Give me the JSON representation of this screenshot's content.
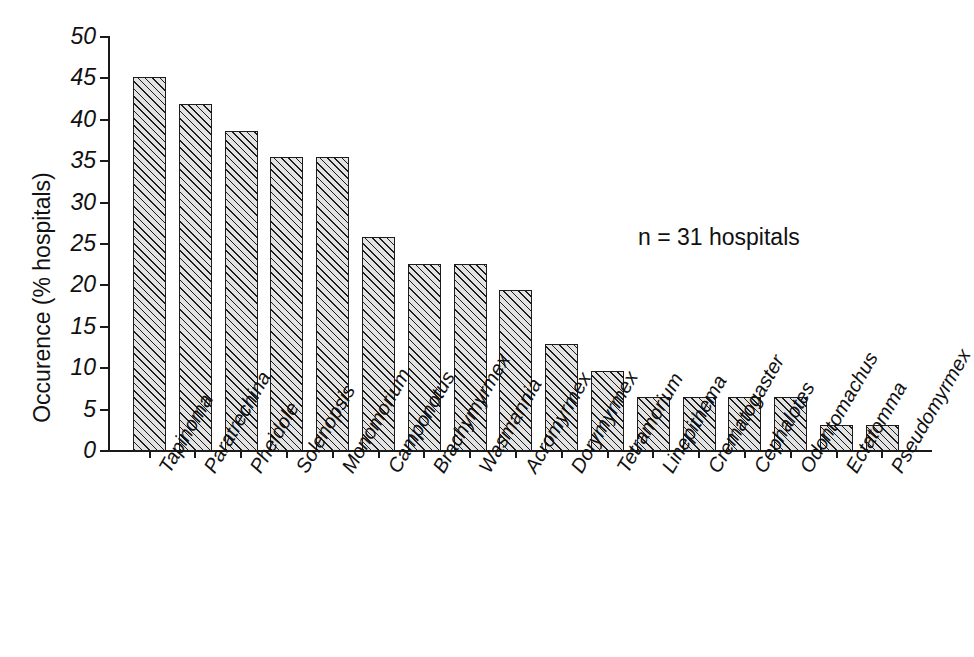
{
  "chart_data": {
    "type": "bar",
    "title": "",
    "subtitle": "",
    "xlabel": "",
    "ylabel": "Occurence (% hospitals)",
    "ylim": [
      0,
      50
    ],
    "ytick_values": [
      0,
      5,
      10,
      15,
      20,
      25,
      30,
      35,
      40,
      45,
      50
    ],
    "ytick_labels": [
      "0",
      "5",
      "10",
      "15",
      "20",
      "25",
      "30",
      "35",
      "40",
      "45",
      "50"
    ],
    "grid": false,
    "legend": null,
    "annotations": [
      {
        "name": "sample-size",
        "text": "n = 31 hospitals"
      }
    ],
    "categories": [
      "Tapinoma",
      "Paratrechina",
      "Pheidole",
      "Solenopsis",
      "Monomorium",
      "Camponotus",
      "Brachymyrmex",
      "Wasmannia",
      "Acromyrmex",
      "Dorymyrmex",
      "Tetramorium",
      "Linepithema",
      "Crematogaster",
      "Cephalotes",
      "Odontomachus",
      "Ectatomma",
      "Pseudomyrmex"
    ],
    "values": [
      45.2,
      41.9,
      38.7,
      35.5,
      35.5,
      25.8,
      22.6,
      22.6,
      19.4,
      12.9,
      9.7,
      6.5,
      6.5,
      6.5,
      6.5,
      3.2,
      3.2
    ],
    "bar_style": {
      "fill": "diagonal-hatch",
      "fill_color": "#e3e3e3",
      "edge_color": "#1c1c1c"
    }
  },
  "colors": {
    "background": "#ffffff",
    "axis": "#1a1a1a",
    "text": "#111111",
    "bar_edge": "#1c1c1c",
    "bar_fill": "#e3e3e3"
  }
}
